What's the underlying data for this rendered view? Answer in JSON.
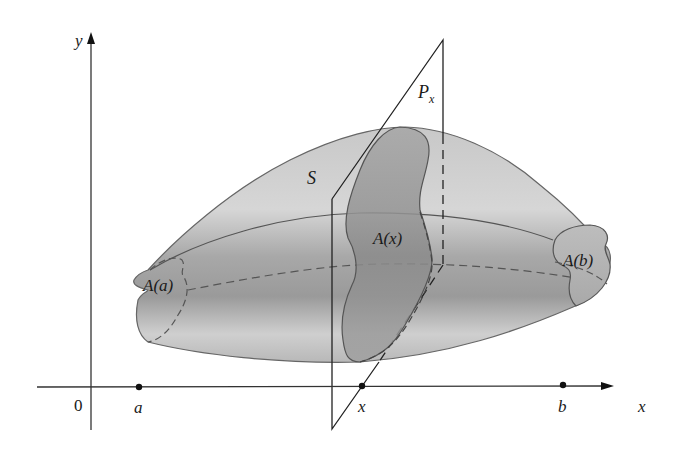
{
  "figure": {
    "labels": {
      "y_axis": "y",
      "x_axis": "x",
      "origin": "0",
      "a": "a",
      "x_point": "x",
      "b": "b",
      "solid": "S",
      "plane": "P",
      "plane_subscript": "x",
      "area_a": "A(a)",
      "area_x": "A(x)",
      "area_b": "A(b)"
    },
    "colors": {
      "solid_fill": "#bdbdbd",
      "solid_light": "#dcdcdc",
      "solid_dark": "#8e8e8e",
      "section_fill": "#9a9a9a",
      "outline": "#555555",
      "axis": "#333333",
      "background": "#ffffff"
    },
    "points": {
      "a": 139,
      "x": 362,
      "b": 563
    }
  }
}
